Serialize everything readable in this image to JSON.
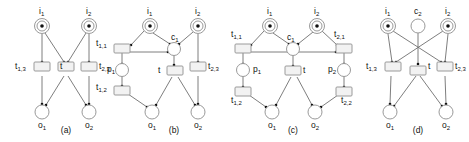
{
  "figure": {
    "type": "petri-net-diagram-set",
    "panel_count": 4,
    "colors": {
      "background": "#ffffff",
      "stroke": "#9a9a9a",
      "arc": "#6f6f6f",
      "token": "#111111",
      "transition_fill": "#f2f2f2",
      "place_fill": "#ffffff",
      "text": "#111111"
    },
    "panels": [
      {
        "id": "a",
        "caption": "(a)",
        "places": [
          {
            "name": "i1",
            "label": "i",
            "sub": "1",
            "tokens": 1,
            "x": 42,
            "y": 26,
            "label_pos": "above"
          },
          {
            "name": "i2",
            "label": "i",
            "sub": "2",
            "tokens": 1,
            "x": 89,
            "y": 26,
            "label_pos": "above"
          },
          {
            "name": "o1",
            "label": "o",
            "sub": "1",
            "tokens": 0,
            "x": 42,
            "y": 112,
            "label_pos": "below"
          },
          {
            "name": "o2",
            "label": "o",
            "sub": "2",
            "tokens": 0,
            "x": 89,
            "y": 112,
            "label_pos": "below"
          }
        ],
        "transitions": [
          {
            "name": "t13",
            "label": "t",
            "sub": "1,3",
            "x": 42,
            "y": 69,
            "label_pos": "left"
          },
          {
            "name": "t",
            "label": "t",
            "sub": "",
            "x": 66,
            "y": 69,
            "label_pos": "left"
          },
          {
            "name": "t23",
            "label": "t",
            "sub": "2,3",
            "x": 89,
            "y": 69,
            "label_pos": "right"
          }
        ],
        "arcs": [
          {
            "from": "i1",
            "to": "t13"
          },
          {
            "from": "i1",
            "to": "t"
          },
          {
            "from": "i2",
            "to": "t"
          },
          {
            "from": "i2",
            "to": "t23"
          },
          {
            "from": "t13",
            "to": "o1"
          },
          {
            "from": "t",
            "to": "o1"
          },
          {
            "from": "t",
            "to": "o2"
          },
          {
            "from": "t23",
            "to": "o2"
          }
        ]
      },
      {
        "id": "b",
        "caption": "(b)",
        "places": [
          {
            "name": "i1",
            "label": "i",
            "sub": "1",
            "tokens": 1,
            "x": 150,
            "y": 26,
            "label_pos": "above"
          },
          {
            "name": "i2",
            "label": "i",
            "sub": "2",
            "tokens": 1,
            "x": 198,
            "y": 26,
            "label_pos": "above"
          },
          {
            "name": "c1",
            "label": "c",
            "sub": "1",
            "tokens": 0,
            "x": 174,
            "y": 48,
            "label_pos": "above-right"
          },
          {
            "name": "p1",
            "label": "p",
            "sub": "1",
            "tokens": 0,
            "x": 122,
            "y": 70,
            "label_pos": "left"
          },
          {
            "name": "o1",
            "label": "o",
            "sub": "1",
            "tokens": 0,
            "x": 152,
            "y": 112,
            "label_pos": "below"
          },
          {
            "name": "o2",
            "label": "o",
            "sub": "2",
            "tokens": 0,
            "x": 198,
            "y": 112,
            "label_pos": "below"
          }
        ],
        "transitions": [
          {
            "name": "t11",
            "label": "t",
            "sub": "1,1",
            "x": 122,
            "y": 48,
            "label_pos": "left"
          },
          {
            "name": "t12",
            "label": "t",
            "sub": "1,2",
            "x": 122,
            "y": 90,
            "label_pos": "left"
          },
          {
            "name": "t",
            "label": "t",
            "sub": "",
            "x": 174,
            "y": 71,
            "label_pos": "left"
          },
          {
            "name": "t23",
            "label": "t",
            "sub": "2,3",
            "x": 198,
            "y": 69,
            "label_pos": "right"
          }
        ],
        "arcs": [
          {
            "from": "i1",
            "to": "t11"
          },
          {
            "from": "i1",
            "to": "c1"
          },
          {
            "from": "i2",
            "to": "c1"
          },
          {
            "from": "i2",
            "to": "t23"
          },
          {
            "from": "t11",
            "to": "p1"
          },
          {
            "from": "t11",
            "to": "c1"
          },
          {
            "from": "p1",
            "to": "t12"
          },
          {
            "from": "c1",
            "to": "t"
          },
          {
            "from": "t12",
            "to": "o1"
          },
          {
            "from": "t",
            "to": "o1"
          },
          {
            "from": "t",
            "to": "o2"
          },
          {
            "from": "t23",
            "to": "o2"
          }
        ]
      },
      {
        "id": "c",
        "caption": "(c)",
        "places": [
          {
            "name": "i1",
            "label": "i",
            "sub": "1",
            "tokens": 1,
            "x": 270,
            "y": 26,
            "label_pos": "above"
          },
          {
            "name": "i2",
            "label": "i",
            "sub": "2",
            "tokens": 1,
            "x": 317,
            "y": 26,
            "label_pos": "above"
          },
          {
            "name": "c1",
            "label": "c",
            "sub": "1",
            "tokens": 0,
            "x": 293,
            "y": 48,
            "label_pos": "above-left"
          },
          {
            "name": "p1",
            "label": "p",
            "sub": "1",
            "tokens": 0,
            "x": 243,
            "y": 70,
            "label_pos": "right"
          },
          {
            "name": "p2",
            "label": "p",
            "sub": "2",
            "tokens": 0,
            "x": 344,
            "y": 70,
            "label_pos": "left"
          },
          {
            "name": "o1",
            "label": "o",
            "sub": "1",
            "tokens": 0,
            "x": 272,
            "y": 112,
            "label_pos": "below"
          },
          {
            "name": "o2",
            "label": "o",
            "sub": "2",
            "tokens": 0,
            "x": 315,
            "y": 112,
            "label_pos": "below"
          }
        ],
        "transitions": [
          {
            "name": "t11",
            "label": "t",
            "sub": "1,1",
            "x": 243,
            "y": 48,
            "label_pos": "above-left"
          },
          {
            "name": "t12",
            "label": "t",
            "sub": "1,2",
            "x": 243,
            "y": 91,
            "label_pos": "below-left"
          },
          {
            "name": "t21",
            "label": "t",
            "sub": "2,1",
            "x": 344,
            "y": 48,
            "label_pos": "above-right"
          },
          {
            "name": "t22",
            "label": "t",
            "sub": "2,2",
            "x": 344,
            "y": 91,
            "label_pos": "below-right"
          },
          {
            "name": "t",
            "label": "t",
            "sub": "",
            "x": 293,
            "y": 71,
            "label_pos": "right"
          }
        ],
        "arcs": [
          {
            "from": "i1",
            "to": "t11"
          },
          {
            "from": "i1",
            "to": "c1"
          },
          {
            "from": "i2",
            "to": "c1"
          },
          {
            "from": "i2",
            "to": "t21"
          },
          {
            "from": "t11",
            "to": "p1"
          },
          {
            "from": "t11",
            "to": "t21-line"
          },
          {
            "from": "p1",
            "to": "t12"
          },
          {
            "from": "t21",
            "to": "p2"
          },
          {
            "from": "p2",
            "to": "t22"
          },
          {
            "from": "c1",
            "to": "t"
          },
          {
            "from": "t12",
            "to": "o1"
          },
          {
            "from": "t",
            "to": "o1"
          },
          {
            "from": "t",
            "to": "o2"
          },
          {
            "from": "t22",
            "to": "o2"
          }
        ]
      },
      {
        "id": "d",
        "caption": "(d)",
        "places": [
          {
            "name": "i1",
            "label": "i",
            "sub": "1",
            "tokens": 1,
            "x": 388,
            "y": 26,
            "label_pos": "above"
          },
          {
            "name": "c2",
            "label": "c",
            "sub": "2",
            "tokens": 0,
            "x": 418,
            "y": 26,
            "label_pos": "above"
          },
          {
            "name": "i2",
            "label": "i",
            "sub": "2",
            "tokens": 1,
            "x": 448,
            "y": 26,
            "label_pos": "above"
          },
          {
            "name": "o1",
            "label": "o",
            "sub": "1",
            "tokens": 0,
            "x": 390,
            "y": 112,
            "label_pos": "below"
          },
          {
            "name": "o2",
            "label": "o",
            "sub": "2",
            "tokens": 0,
            "x": 446,
            "y": 112,
            "label_pos": "below"
          }
        ],
        "transitions": [
          {
            "name": "t13",
            "label": "t",
            "sub": "1,3",
            "x": 393,
            "y": 69,
            "label_pos": "left"
          },
          {
            "name": "t",
            "label": "t",
            "sub": "",
            "x": 418,
            "y": 70,
            "label_pos": "right"
          },
          {
            "name": "t23",
            "label": "t",
            "sub": "2,3",
            "x": 444,
            "y": 69,
            "label_pos": "right"
          }
        ],
        "arcs": [
          {
            "from": "i1",
            "to": "t13"
          },
          {
            "from": "i1",
            "to": "t23"
          },
          {
            "from": "i2",
            "to": "t23"
          },
          {
            "from": "i2",
            "to": "t13"
          },
          {
            "from": "c2",
            "to": "t"
          },
          {
            "from": "t13",
            "to": "o1"
          },
          {
            "from": "t",
            "to": "o1"
          },
          {
            "from": "t",
            "to": "o2"
          },
          {
            "from": "t23",
            "to": "o2"
          }
        ]
      }
    ],
    "labels": {
      "a": {
        "i1": "i",
        "i1_sub": "1",
        "i2": "i",
        "i2_sub": "2",
        "o1": "o",
        "o1_sub": "1",
        "o2": "o",
        "o2_sub": "2",
        "t13": "t",
        "t13_sub": "1,3",
        "t": "t",
        "t_sub": "",
        "t23": "t",
        "t23_sub": "2,3",
        "caption": "(a)"
      },
      "b": {
        "i1": "i",
        "i1_sub": "1",
        "i2": "i",
        "i2_sub": "2",
        "c1": "c",
        "c1_sub": "1",
        "p1": "p",
        "p1_sub": "1",
        "o1": "o",
        "o1_sub": "1",
        "o2": "o",
        "o2_sub": "2",
        "t11": "t",
        "t11_sub": "1,1",
        "t12": "t",
        "t12_sub": "1,2",
        "t": "t",
        "t_sub": "",
        "t23": "t",
        "t23_sub": "2,3",
        "caption": "(b)"
      },
      "c": {
        "i1": "i",
        "i1_sub": "1",
        "i2": "i",
        "i2_sub": "2",
        "c1": "c",
        "c1_sub": "1",
        "p1": "p",
        "p1_sub": "1",
        "p2": "p",
        "p2_sub": "2",
        "o1": "o",
        "o1_sub": "1",
        "o2": "o",
        "o2_sub": "2",
        "t11": "t",
        "t11_sub": "1,1",
        "t12": "t",
        "t12_sub": "1,2",
        "t21": "t",
        "t21_sub": "2,1",
        "t22": "t",
        "t22_sub": "2,2",
        "t": "t",
        "t_sub": "",
        "caption": "(c)"
      },
      "d": {
        "i1": "i",
        "i1_sub": "1",
        "c2": "c",
        "c2_sub": "2",
        "i2": "i",
        "i2_sub": "2",
        "o1": "o",
        "o1_sub": "1",
        "o2": "o",
        "o2_sub": "2",
        "t13": "t",
        "t13_sub": "1,3",
        "t": "t",
        "t_sub": "",
        "t23": "t",
        "t23_sub": "2,3",
        "caption": "(d)"
      }
    }
  }
}
